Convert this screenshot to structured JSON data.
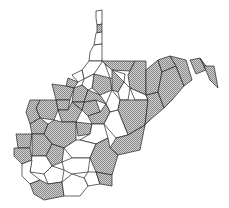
{
  "map": {
    "title": "West Virginia counties",
    "legend": {
      "shaded_pattern": "crosshatch-gray",
      "unshaded": "white"
    },
    "colors": {
      "shaded_fill": "#b8b8b8",
      "border": "#222222",
      "background": "#ffffff"
    },
    "counties": [
      {
        "id": "hancock",
        "shaded": false,
        "points": "96,11 102,10 102,24 97,25 96,18"
      },
      {
        "id": "brooke",
        "shaded": true,
        "points": "97,25 102,24 102,32 97,33"
      },
      {
        "id": "ohio",
        "shaded": false,
        "points": "96,33 102,32 102,44 94,45"
      },
      {
        "id": "marshall",
        "shaded": false,
        "points": "94,45 102,44 102,61 89,61 90,52"
      },
      {
        "id": "wetzel",
        "shaded": false,
        "points": "89,61 102,61 102,62 94,74 84,79 82,70"
      },
      {
        "id": "tyler",
        "shaded": false,
        "points": "82,70 84,79 78,82 72,75"
      },
      {
        "id": "monongalia",
        "shaded": true,
        "points": "102,61 135,61 130,71 112,70 105,64"
      },
      {
        "id": "preston",
        "shaded": true,
        "points": "135,61 146,61 146,95 130,88 128,75"
      },
      {
        "id": "marion",
        "shaded": false,
        "points": "105,64 112,70 125,74 124,82 110,78"
      },
      {
        "id": "harrison",
        "shaded": true,
        "points": "94,74 110,78 112,90 100,95 92,88"
      },
      {
        "id": "doddridge",
        "shaded": false,
        "points": "84,79 94,74 92,88 88,90 82,85"
      },
      {
        "id": "taylor",
        "shaded": true,
        "points": "112,70 124,82 118,92 112,90"
      },
      {
        "id": "barbour",
        "shaded": false,
        "points": "118,92 124,82 130,88 128,100 120,100"
      },
      {
        "id": "tucker",
        "shaded": false,
        "points": "130,88 146,95 148,100 135,100"
      },
      {
        "id": "pleasants",
        "shaded": true,
        "points": "68,78 78,82 74,88 66,86"
      },
      {
        "id": "wood",
        "shaded": true,
        "points": "52,84 66,86 74,88 70,100 56,100"
      },
      {
        "id": "ritchie",
        "shaded": true,
        "points": "74,88 82,85 88,90 84,102 72,102"
      },
      {
        "id": "wirt",
        "shaded": true,
        "points": "56,100 70,100 68,110 58,110"
      },
      {
        "id": "gilmer",
        "shaded": true,
        "points": "84,102 96,100 100,112 88,116 82,110"
      },
      {
        "id": "lewis",
        "shaded": true,
        "points": "88,90 100,95 106,104 96,100 84,102"
      },
      {
        "id": "upshur",
        "shaded": false,
        "points": "106,104 112,90 120,100 118,110 110,112"
      },
      {
        "id": "randolph",
        "shaded": true,
        "points": "120,100 135,100 148,100 145,125 128,135 118,110"
      },
      {
        "id": "jackson",
        "shaded": true,
        "points": "40,100 56,100 58,110 54,120 40,118 36,108"
      },
      {
        "id": "roane",
        "shaded": true,
        "points": "58,110 68,110 72,102 82,110 76,122 62,122"
      },
      {
        "id": "calhoun",
        "shaded": true,
        "points": "72,102 84,102 82,110"
      },
      {
        "id": "braxton",
        "shaded": true,
        "points": "88,116 100,112 106,104 110,112 104,124 92,124"
      },
      {
        "id": "webster",
        "shaded": false,
        "points": "110,112 118,110 128,135 116,138 104,124"
      },
      {
        "id": "mason",
        "shaded": true,
        "points": "30,100 40,100 36,108 40,118 30,124 26,112"
      },
      {
        "id": "putnam",
        "shaded": true,
        "points": "30,124 40,118 48,124 44,134 32,134"
      },
      {
        "id": "kanawha",
        "shaded": true,
        "points": "48,124 54,120 62,122 76,122 76,140 64,148 52,144 44,134"
      },
      {
        "id": "clay",
        "shaded": true,
        "points": "76,122 92,124 90,134 78,136"
      },
      {
        "id": "nicholas",
        "shaded": false,
        "points": "90,134 92,124 104,124 108,138 96,144 80,140"
      },
      {
        "id": "pocahontas",
        "shaded": true,
        "points": "116,138 128,135 145,125 140,150 118,155 110,148"
      },
      {
        "id": "pendleton",
        "shaded": true,
        "points": "146,95 158,92 164,108 150,120 145,125 148,100"
      },
      {
        "id": "grant",
        "shaded": true,
        "points": "146,95 146,70 158,60 162,72 158,92"
      },
      {
        "id": "mineral",
        "shaded": true,
        "points": "158,60 170,56 176,66 162,72"
      },
      {
        "id": "hardy",
        "shaded": true,
        "points": "162,72 176,66 184,86 172,100 164,108 158,92"
      },
      {
        "id": "hampshire",
        "shaded": true,
        "points": "170,56 186,60 192,80 184,86 176,66"
      },
      {
        "id": "morgan",
        "shaded": true,
        "points": "190,60 200,58 206,70 196,74"
      },
      {
        "id": "berkeley",
        "shaded": true,
        "points": "200,58 206,66 214,74 206,70"
      },
      {
        "id": "jefferson",
        "shaded": true,
        "points": "204,66 214,66 218,88 210,80"
      },
      {
        "id": "cabell",
        "shaded": true,
        "points": "16,134 32,134 30,148 18,148"
      },
      {
        "id": "wayne",
        "shaded": true,
        "points": "14,148 30,148 32,160 22,164 14,156"
      },
      {
        "id": "lincoln",
        "shaded": true,
        "points": "32,134 44,134 52,144 46,156 32,156"
      },
      {
        "id": "boone",
        "shaded": true,
        "points": "46,156 52,144 64,148 62,162 52,166"
      },
      {
        "id": "fayette",
        "shaded": false,
        "points": "64,148 76,140 80,140 96,144 90,158 72,158"
      },
      {
        "id": "greenbrier",
        "shaded": true,
        "points": "96,144 108,138 110,148 118,155 112,175 96,172 90,158"
      },
      {
        "id": "logan",
        "shaded": false,
        "points": "32,156 46,156 52,166 44,174 30,172"
      },
      {
        "id": "mingo",
        "shaded": false,
        "points": "22,164 32,160 30,172 40,180 30,184 22,176"
      },
      {
        "id": "raleigh",
        "shaded": false,
        "points": "62,162 72,158 90,158 88,172 72,174 64,170"
      },
      {
        "id": "wyoming",
        "shaded": false,
        "points": "44,174 52,166 64,170 62,182 48,184"
      },
      {
        "id": "summers",
        "shaded": false,
        "points": "88,172 96,172 100,184 88,186 84,178"
      },
      {
        "id": "monroe",
        "shaded": true,
        "points": "96,172 112,175 112,186 100,184"
      },
      {
        "id": "mcdowell",
        "shaded": true,
        "points": "30,184 40,180 48,184 62,182 64,196 44,200 34,194"
      },
      {
        "id": "mercer",
        "shaded": false,
        "points": "62,182 72,174 84,178 88,186 80,196 64,196"
      }
    ]
  }
}
